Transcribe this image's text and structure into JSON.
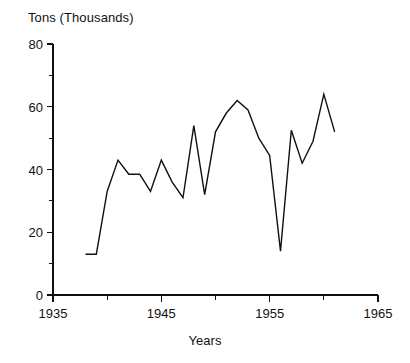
{
  "chart_data": {
    "type": "line",
    "title": "",
    "subtitle": "",
    "ylabel": "Tons (Thousands)",
    "xlabel": "Years",
    "xlim": [
      1935,
      1965
    ],
    "ylim": [
      0,
      80
    ],
    "grid": false,
    "legend": false,
    "legend_position": "none",
    "x_tick_labels": [
      "1935",
      "1945",
      "1955",
      "1965"
    ],
    "x_major_ticks": [
      1935,
      1945,
      1955,
      1965
    ],
    "x_minor_ticks": [
      1940,
      1950,
      1960
    ],
    "y_tick_labels": [
      "0",
      "20",
      "40",
      "60",
      "80"
    ],
    "y_major_ticks": [
      0,
      20,
      40,
      60,
      80
    ],
    "y_minor_ticks": [
      10,
      30,
      50,
      70
    ],
    "series": [
      {
        "name": "Tons (Thousands)",
        "color": "#101010",
        "x": [
          1938,
          1939,
          1940,
          1941,
          1942,
          1943,
          1944,
          1945,
          1946,
          1947,
          1948,
          1949,
          1950,
          1951,
          1952,
          1953,
          1954,
          1955,
          1956,
          1957,
          1958,
          1959,
          1960,
          1961
        ],
        "values": [
          13,
          13,
          33,
          43,
          38.5,
          38.5,
          33,
          43,
          36,
          31,
          54,
          32,
          52,
          58,
          62,
          59,
          50,
          44.5,
          14,
          52.5,
          42,
          49,
          64,
          52
        ]
      }
    ],
    "annotations": []
  },
  "axes": {
    "y_axis_title": "Tons (Thousands)",
    "x_axis_title": "Years"
  },
  "colors": {
    "line": "#101010",
    "axis": "#101010",
    "background": "#ffffff"
  }
}
